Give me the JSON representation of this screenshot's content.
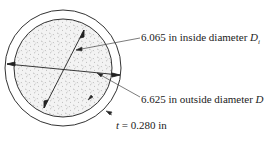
{
  "figure": {
    "inside_label": {
      "value": "6.065 in inside diameter ",
      "symbol": "D",
      "subscript": "i"
    },
    "outside_label": {
      "value": "6.625 in outside diameter ",
      "symbol": "D"
    },
    "thickness_label": {
      "symbol": "t",
      "value": " = 0.280 in"
    }
  },
  "colors": {
    "stroke": "#333333",
    "fill_pattern": "#9a9a9a",
    "background": "#ffffff"
  }
}
